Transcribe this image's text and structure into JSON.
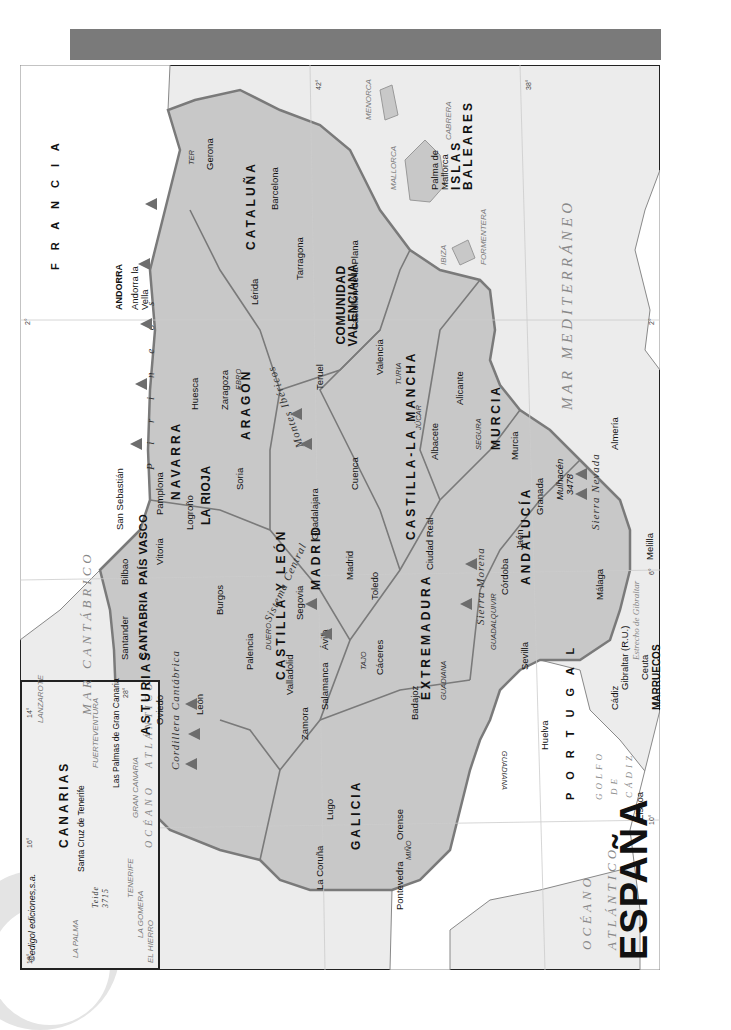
{
  "title": "ESPAÑA",
  "copyright": "©edigol ediciones,s.a.",
  "colors": {
    "spain_fill": "#c8c8c8",
    "sea_fill": "#ececec",
    "other_land": "#ffffff",
    "border": "#7a7a7a",
    "mountain": "#6d6d6d",
    "header_bar": "#7a7a7a"
  },
  "regions": [
    {
      "name": "GALICIA"
    },
    {
      "name": "ASTURIAS"
    },
    {
      "name": "CANTABRIA"
    },
    {
      "name": "PAÍS VASCO"
    },
    {
      "name": "NAVARRA"
    },
    {
      "name": "LA RIOJA"
    },
    {
      "name": "ARAGÓN"
    },
    {
      "name": "CATALUÑA"
    },
    {
      "name": "CASTILLA Y LEÓN"
    },
    {
      "name": "MADRID"
    },
    {
      "name": "CASTILLA-LA MANCHA"
    },
    {
      "name": "COMUNIDAD VALENCIANA"
    },
    {
      "name": "EXTREMADURA"
    },
    {
      "name": "ANDALUCÍA"
    },
    {
      "name": "MURCIA"
    },
    {
      "name": "ISLAS BALEARES"
    },
    {
      "name": "CANARIAS"
    }
  ],
  "cities": {
    "la_coruna": "La Coruña",
    "lugo": "Lugo",
    "orense": "Orense",
    "pontevedra": "Pontevedra",
    "oviedo": "Oviedo",
    "santander": "Santander",
    "bilbao": "Bilbao",
    "san_sebastian": "San Sebastián",
    "vitoria": "Vitoria",
    "pamplona": "Pamplona",
    "logrono": "Logroño",
    "huesca": "Huesca",
    "zaragoza": "Zaragoza",
    "teruel": "Teruel",
    "lerida": "Lérida",
    "gerona": "Gerona",
    "barcelona": "Barcelona",
    "tarragona": "Tarragona",
    "leon": "León",
    "burgos": "Burgos",
    "palencia": "Palencia",
    "valladolid": "Valladolid",
    "zamora": "Zamora",
    "salamanca": "Salamanca",
    "avila": "Ávila",
    "segovia": "Segovia",
    "soria": "Soria",
    "madrid": "Madrid",
    "guadalajara": "Guadalajara",
    "cuenca": "Cuenca",
    "toledo": "Toledo",
    "ciudad_real": "Ciudad Real",
    "albacete": "Albacete",
    "castellon": "Castellón de la Plana",
    "valencia": "Valencia",
    "alicante": "Alicante",
    "murcia": "Murcia",
    "caceres": "Cáceres",
    "badajoz": "Badajoz",
    "huelva": "Huelva",
    "sevilla": "Sevilla",
    "cadiz": "Cádiz",
    "cordoba": "Córdoba",
    "jaen": "Jaén",
    "granada": "Granada",
    "malaga": "Málaga",
    "almeria": "Almería",
    "gibraltar": "Gibraltar (R.U.)",
    "ceuta": "Ceuta",
    "melilla": "Melilla",
    "palma": "Palma de Mallorca",
    "lisboa": "Lisboa",
    "andorra_la_vella": "Andorra la Vella",
    "santa_cruz": "Santa Cruz de Tenerife",
    "las_palmas": "Las Palmas de Gran Canaria"
  },
  "countries": {
    "francia": "F R A N C I A",
    "portugal": "P O R T U G A L",
    "andorra": "ANDORRA",
    "marruecos": "MARRUECOS"
  },
  "seas": {
    "cantabrico": "MAR CANTÁBRICO",
    "mediterraneo": "MAR MEDITERRÁNEO",
    "oceano": "OCÉANO",
    "atlantico": "ATLÁNTICO",
    "golfo": "GOLFO",
    "de": "DE",
    "cadiz": "CÁDIZ",
    "estrecho": "Estrecho de Gibraltar",
    "inset_oceano": "OCÉANO",
    "inset_atlantico": "ATLÁNTICO"
  },
  "rivers": {
    "mino": "MIÑO",
    "duero": "DUERO",
    "ebro": "EBRO",
    "tajo": "TAJO",
    "guadiana": "GUADIANA",
    "guadiana2": "GUADIANA",
    "guadalquivir": "GUADALQUIVIR",
    "jucar": "JÚCAR",
    "turia": "TURIA",
    "segura": "SEGURA",
    "ter": "TER"
  },
  "mountains": {
    "cantabrica": "Cordillera Cantábrica",
    "pirineos": "P i r i n e o s",
    "iberico": "Montes Ibéricos",
    "central": "Sistema Central",
    "morena": "Sierra Morena",
    "nevada": "Sierra Nevada",
    "mulhacen": "Mulhacén",
    "mulhacen_alt": "3478",
    "teide": "Teide",
    "teide_alt": "3715"
  },
  "islands": {
    "menorca": "MENORCA",
    "mallorca": "MALLORCA",
    "cabrera": "CABRERA",
    "ibiza": "IBIZA",
    "formentera": "FORMENTERA",
    "lanzarote": "LANZAROTE",
    "fuerteventura": "FUERTEVENTURA",
    "gran_canaria": "GRAN CANARIA",
    "tenerife": "TENERIFE",
    "la_gomera": "LA GOMERA",
    "la_palma": "LA PALMA",
    "el_hierro": "EL HIERRO"
  },
  "graticule": {
    "lat_42": "42°",
    "lat_38": "38°",
    "lon_10": "10°",
    "lon_6": "6°",
    "lon_2w": "2°",
    "lon_2e": "2°",
    "inset_28": "28°",
    "inset_18": "18°",
    "inset_16": "16°",
    "inset_14": "14°"
  }
}
